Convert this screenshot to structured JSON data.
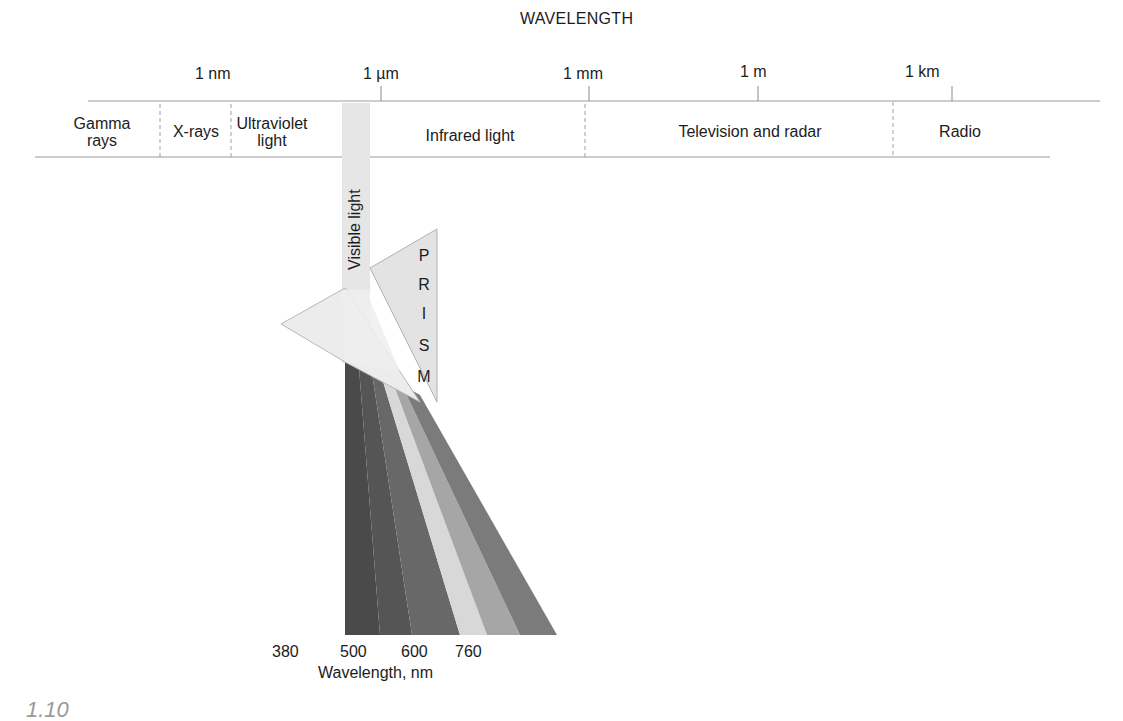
{
  "diagram": {
    "title": "WAVELENGTH",
    "scale_ticks": [
      {
        "label": "1 nm"
      },
      {
        "label": "1 µm"
      },
      {
        "label": "1 mm"
      },
      {
        "label": "1 m"
      },
      {
        "label": "1 km"
      }
    ],
    "regions": [
      {
        "line1": "Gamma",
        "line2": "rays"
      },
      {
        "line1": "X-rays"
      },
      {
        "line1": "Ultraviolet",
        "line2": "light"
      },
      {
        "line1": "Infrared light"
      },
      {
        "line1": "Television and radar"
      },
      {
        "line1": "Radio"
      }
    ],
    "visible_light_label": "Visible light",
    "prism_letters": [
      "P",
      "R",
      "I",
      "S",
      "M"
    ],
    "spectrum": {
      "axis_ticks": [
        "380",
        "500",
        "600",
        "760"
      ],
      "axis_label": "Wavelength, nm",
      "band_colors": [
        "#4a4a4a",
        "#585858",
        "#6b6b6b",
        "#d9d9d9",
        "#a9a9a9",
        "#7d7d7d"
      ]
    },
    "figure_number_partial": "1.10"
  }
}
